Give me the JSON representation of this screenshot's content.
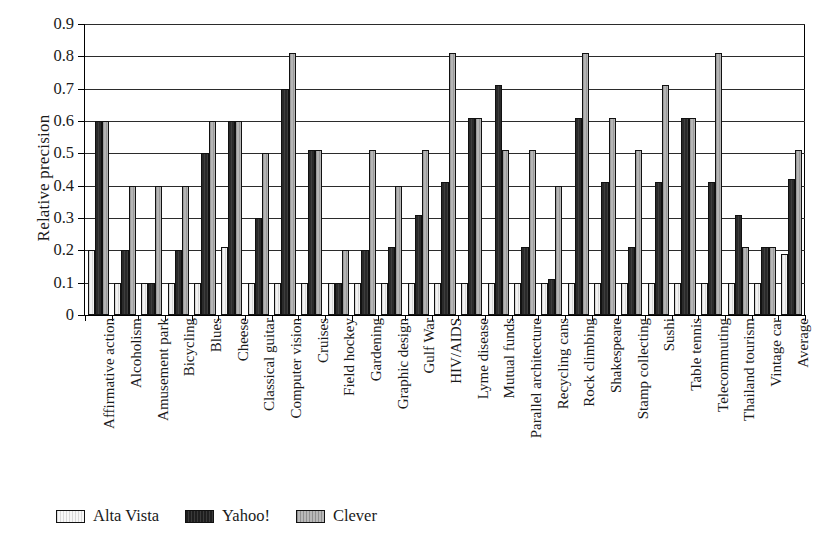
{
  "chart_data": {
    "type": "bar",
    "title": "",
    "xlabel": "",
    "ylabel": "Relative precision",
    "ylim": [
      0,
      0.9
    ],
    "ytick_labels": [
      "0",
      "0.1",
      "0.2",
      "0.3",
      "0.4",
      "0.5",
      "0.6",
      "0.7",
      "0.8",
      "0.9"
    ],
    "ytick_values": [
      0,
      0.1,
      0.2,
      0.3,
      0.4,
      0.5,
      0.6,
      0.7,
      0.8,
      0.9
    ],
    "grid": true,
    "legend_position": "bottom-left",
    "categories": [
      "Affirmative action",
      "Alcoholism",
      "Amusement park",
      "Bicycling",
      "Blues",
      "Cheese",
      "Classical guitar",
      "Computer vision",
      "Cruises",
      "Field hockey",
      "Gardening",
      "Graphic design",
      "Gulf War",
      "HIV/AIDS",
      "Lyme disease",
      "Mutual funds",
      "Parallel architecture",
      "Recycling cans",
      "Rock climbing",
      "Shakespeare",
      "Stamp collecting",
      "Sushi",
      "Table tennis",
      "Telecommuting",
      "Thailand tourism",
      "Vintage car",
      "Average"
    ],
    "series": [
      {
        "name": "Alta Vista",
        "color": "#f2f2f2",
        "values": [
          0.2,
          0.1,
          0.1,
          0.1,
          0.1,
          0.21,
          0.1,
          0.1,
          0.1,
          0.1,
          0.1,
          0.1,
          0.1,
          0.1,
          0.1,
          0.1,
          0.1,
          0.1,
          0.1,
          0.1,
          0.1,
          0.1,
          0.1,
          0.1,
          0.1,
          0.1,
          0.19
        ]
      },
      {
        "name": "Yahoo!",
        "color": "#2f2f2f",
        "values": [
          0.6,
          0.2,
          0.1,
          0.2,
          0.5,
          0.6,
          0.3,
          0.7,
          0.51,
          0.1,
          0.2,
          0.21,
          0.31,
          0.41,
          0.61,
          0.71,
          0.21,
          0.11,
          0.61,
          0.41,
          0.21,
          0.41,
          0.61,
          0.41,
          0.31,
          0.21,
          0.42
        ]
      },
      {
        "name": "Clever",
        "color": "#aaaaaa",
        "values": [
          0.6,
          0.4,
          0.4,
          0.4,
          0.6,
          0.6,
          0.5,
          0.81,
          0.51,
          0.2,
          0.51,
          0.4,
          0.51,
          0.81,
          0.61,
          0.51,
          0.51,
          0.4,
          0.81,
          0.61,
          0.51,
          0.71,
          0.61,
          0.81,
          0.21,
          0.21,
          0.51
        ]
      }
    ]
  },
  "legend": {
    "items": [
      {
        "label": "Alta Vista"
      },
      {
        "label": "Yahoo!"
      },
      {
        "label": "Clever"
      }
    ]
  }
}
